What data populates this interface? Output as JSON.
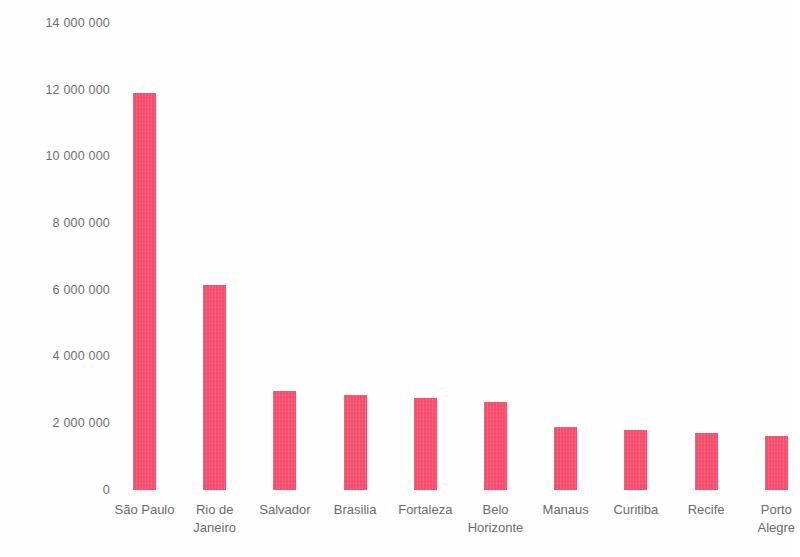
{
  "chart_data": {
    "type": "bar",
    "title": "",
    "subtitle": "",
    "xlabel": "",
    "ylabel": "",
    "categories": [
      "São Paulo",
      "Rio de Janeiro",
      "Salvador",
      "Brasilia",
      "Fortaleza",
      "Belo Horizonte",
      "Manaus",
      "Curitiba",
      "Recife",
      "Porto Alegre"
    ],
    "category_lines": [
      [
        "São Paulo"
      ],
      [
        "Rio de",
        "Janeiro"
      ],
      [
        "Salvador"
      ],
      [
        "Brasilia"
      ],
      [
        "Fortaleza"
      ],
      [
        "Belo",
        "Horizonte"
      ],
      [
        "Manaus"
      ],
      [
        "Curitiba"
      ],
      [
        "Recife"
      ],
      [
        "Porto",
        "Alegre"
      ]
    ],
    "values": [
      11900000,
      6150000,
      2980000,
      2860000,
      2750000,
      2630000,
      1880000,
      1810000,
      1710000,
      1620000
    ],
    "ylim": [
      0,
      14000000
    ],
    "ytick_values": [
      0,
      2000000,
      4000000,
      6000000,
      8000000,
      10000000,
      12000000,
      14000000
    ],
    "ytick_labels": [
      "0",
      "2 000 000",
      "4 000 000",
      "6 000 000",
      "8 000 000",
      "10 000 000",
      "12 000 000",
      "14 000 000"
    ],
    "grid": false,
    "legend": null,
    "legend_position": "none",
    "bar_color": "#fa4e6e",
    "axis_text_color": "#6b6b6b",
    "background_color": "#fefefe"
  }
}
